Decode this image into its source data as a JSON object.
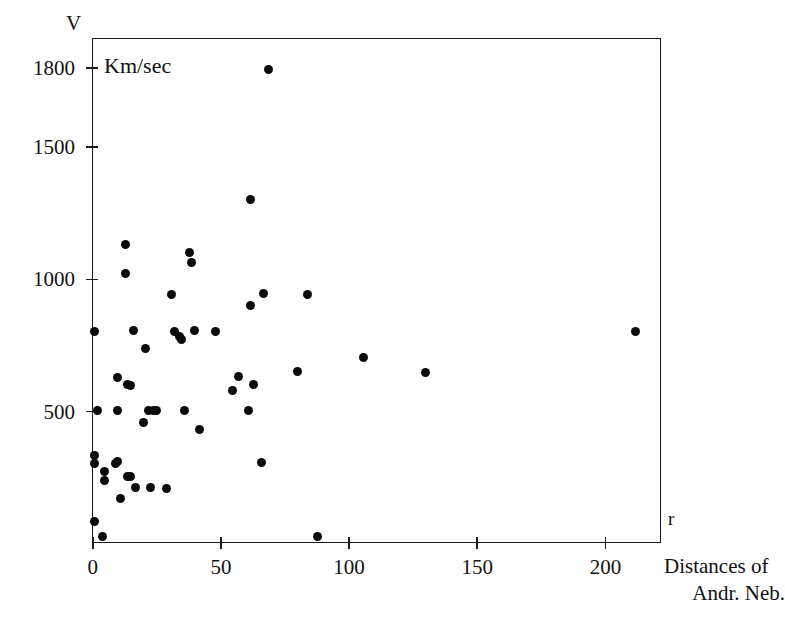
{
  "figure": {
    "background_color": "#ffffff",
    "ink_color": "#0b0b0b"
  },
  "axes": {
    "y_axis_title": "V",
    "x_axis_title": "r",
    "unit_annotation": "Km/sec",
    "x_caption_line1": "Distances of",
    "x_caption_line2": "Andr. Neb.",
    "y_ticks": [
      "1800",
      "1500",
      "1000",
      "500"
    ],
    "x_ticks": [
      "0",
      "50",
      "100",
      "150",
      "200"
    ]
  },
  "chart_data": {
    "type": "scatter",
    "title": "",
    "xlabel": "r",
    "ylabel": "V",
    "x_unit": "Distances of Andr. Neb.",
    "y_unit": "Km/sec",
    "xlim": [
      0,
      222
    ],
    "ylim": [
      0,
      1910
    ],
    "x_ticks": [
      0,
      50,
      100,
      150,
      200
    ],
    "y_ticks": [
      500,
      1000,
      1500,
      1800
    ],
    "grid": false,
    "legend": null,
    "marker": "filled-circle",
    "marker_color": "#0b0b0b",
    "n_points": 54,
    "points": [
      {
        "r": 1,
        "v": 800
      },
      {
        "r": 2,
        "v": 500
      },
      {
        "r": 1,
        "v": 330
      },
      {
        "r": 1,
        "v": 300
      },
      {
        "r": 1,
        "v": 80
      },
      {
        "r": 4,
        "v": 25
      },
      {
        "r": 5,
        "v": 270
      },
      {
        "r": 5,
        "v": 235
      },
      {
        "r": 9,
        "v": 300
      },
      {
        "r": 10,
        "v": 310
      },
      {
        "r": 10,
        "v": 625
      },
      {
        "r": 10,
        "v": 500
      },
      {
        "r": 11,
        "v": 170
      },
      {
        "r": 13,
        "v": 1130
      },
      {
        "r": 13,
        "v": 1020
      },
      {
        "r": 14,
        "v": 600
      },
      {
        "r": 14,
        "v": 250
      },
      {
        "r": 15,
        "v": 595
      },
      {
        "r": 15,
        "v": 250
      },
      {
        "r": 16,
        "v": 805
      },
      {
        "r": 17,
        "v": 210
      },
      {
        "r": 20,
        "v": 455
      },
      {
        "r": 21,
        "v": 735
      },
      {
        "r": 22,
        "v": 500
      },
      {
        "r": 23,
        "v": 210
      },
      {
        "r": 24,
        "v": 500
      },
      {
        "r": 25,
        "v": 500
      },
      {
        "r": 29,
        "v": 205
      },
      {
        "r": 31,
        "v": 940
      },
      {
        "r": 32,
        "v": 800
      },
      {
        "r": 34,
        "v": 780
      },
      {
        "r": 35,
        "v": 770
      },
      {
        "r": 36,
        "v": 500
      },
      {
        "r": 38,
        "v": 1100
      },
      {
        "r": 39,
        "v": 1060
      },
      {
        "r": 40,
        "v": 805
      },
      {
        "r": 42,
        "v": 430
      },
      {
        "r": 48,
        "v": 800
      },
      {
        "r": 55,
        "v": 575
      },
      {
        "r": 57,
        "v": 630
      },
      {
        "r": 61,
        "v": 500
      },
      {
        "r": 62,
        "v": 1300
      },
      {
        "r": 62,
        "v": 900
      },
      {
        "r": 63,
        "v": 600
      },
      {
        "r": 66,
        "v": 305
      },
      {
        "r": 67,
        "v": 945
      },
      {
        "r": 69,
        "v": 1790
      },
      {
        "r": 80,
        "v": 650
      },
      {
        "r": 84,
        "v": 940
      },
      {
        "r": 88,
        "v": 25
      },
      {
        "r": 106,
        "v": 700
      },
      {
        "r": 130,
        "v": 645
      },
      {
        "r": 212,
        "v": 800
      }
    ]
  }
}
